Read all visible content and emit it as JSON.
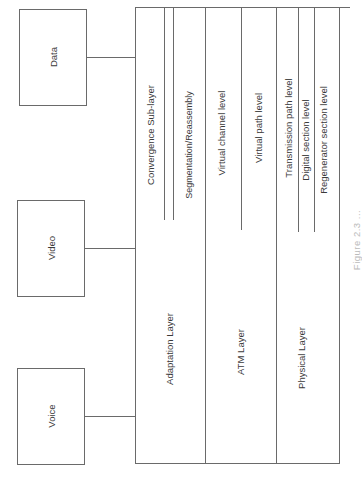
{
  "diagram": {
    "type": "layered-protocol-stack",
    "orientation": "rotated-90-ccw",
    "sources": [
      {
        "label": "Data"
      },
      {
        "label": "Video"
      },
      {
        "label": "Voice"
      }
    ],
    "layers": [
      {
        "label": "Adaptation Layer",
        "sublayers": [
          {
            "label": "Convergence Sub-layer"
          },
          {
            "label": "Segmentation/Reassembly"
          }
        ]
      },
      {
        "label": "ATM Layer",
        "sublayers": [
          {
            "label": "Virtual channel level"
          },
          {
            "label": "Virtual path level"
          }
        ]
      },
      {
        "label": "Physical Layer",
        "sublayers": [
          {
            "label": "Transmission path level"
          },
          {
            "label": "Digital section level"
          },
          {
            "label": "Regenerator section level"
          }
        ]
      }
    ],
    "caption": "Figure 2.3 ...",
    "line_color": "#6a6a6a",
    "text_color": "#3a3a3a"
  }
}
